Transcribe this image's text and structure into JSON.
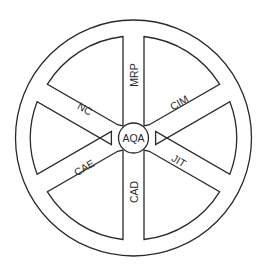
{
  "diagram": {
    "type": "wheel",
    "hub": {
      "label": "AQA"
    },
    "spokes": [
      {
        "label": "MRP",
        "position": "top"
      },
      {
        "label": "CIM",
        "position": "upper-right"
      },
      {
        "label": "JIT",
        "position": "lower-right"
      },
      {
        "label": "CAD",
        "position": "bottom"
      },
      {
        "label": "CAE",
        "position": "lower-left"
      },
      {
        "label": "NC",
        "position": "upper-left"
      }
    ],
    "colors": {
      "line": "#2a2a2a",
      "background": "#ffffff"
    }
  }
}
